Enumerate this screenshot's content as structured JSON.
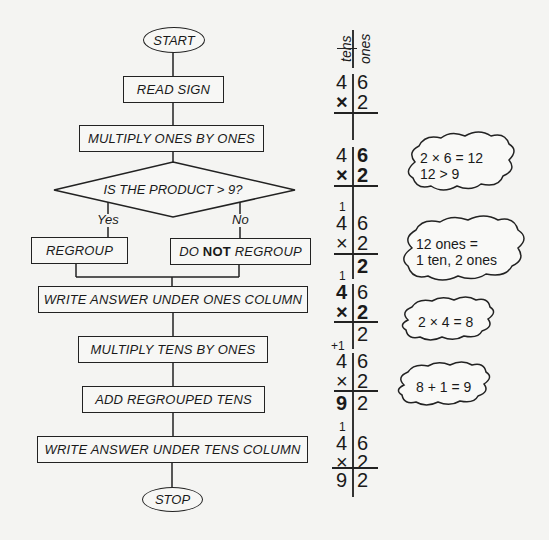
{
  "flowchart": {
    "start": "START",
    "read_sign": "READ SIGN",
    "multiply_ones": "MULTIPLY ONES BY ONES",
    "decision": "IS THE PRODUCT > 9?",
    "yes_label": "Yes",
    "no_label": "No",
    "regroup": "REGROUP",
    "do_not_regroup": {
      "pre": "DO ",
      "bold": "NOT",
      "post": " REGROUP"
    },
    "write_ones": "WRITE ANSWER UNDER ONES COLUMN",
    "multiply_tens": "MULTIPLY TENS BY ONES",
    "add_regrouped": "ADD REGROUPED TENS",
    "write_tens": "WRITE ANSWER UNDER TENS COLUMN",
    "stop": "STOP"
  },
  "place_value": {
    "tens_header": "tens",
    "ones_header": "ones",
    "times_sign": "×",
    "steps": [
      {
        "carry": "",
        "top": [
          "4",
          "6"
        ],
        "bottom": "2",
        "result": [
          "",
          ""
        ],
        "note": []
      },
      {
        "carry": "",
        "top": [
          "4",
          "6"
        ],
        "bottom": "2",
        "result": [
          "",
          ""
        ],
        "note": [
          "2 × 6 = 12",
          "12 > 9"
        ]
      },
      {
        "carry": "1",
        "top": [
          "4",
          "6"
        ],
        "bottom": "2",
        "result": [
          "",
          "2"
        ],
        "note": [
          "12 ones =",
          "1 ten, 2 ones"
        ]
      },
      {
        "carry": "1",
        "top": [
          "4",
          "6"
        ],
        "bottom": "2",
        "result": [
          "",
          "2"
        ],
        "note": [
          "2 × 4 = 8"
        ]
      },
      {
        "carry": "+1",
        "top": [
          "4",
          "6"
        ],
        "bottom": "2",
        "result": [
          "9",
          "2"
        ],
        "note": [
          "8 + 1 = 9"
        ]
      },
      {
        "carry": "1",
        "top": [
          "4",
          "6"
        ],
        "bottom": "2",
        "result": [
          "9",
          "2"
        ],
        "note": []
      }
    ]
  }
}
